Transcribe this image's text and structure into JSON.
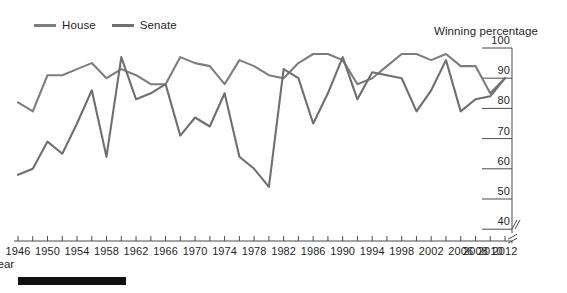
{
  "legend": {
    "items": [
      {
        "label": "House",
        "color": "#7d7d7d"
      },
      {
        "label": "Senate",
        "color": "#6f6f6f"
      }
    ]
  },
  "axes": {
    "y_caption": "Winning percentage",
    "x_caption": "Year",
    "y_ticks": [
      "100",
      "90",
      "80",
      "70",
      "60",
      "50",
      "40"
    ],
    "x_ticks": [
      "1946",
      "1950",
      "1954",
      "1958",
      "1962",
      "1966",
      "1970",
      "1974",
      "1978",
      "1982",
      "1986",
      "1990",
      "1994",
      "1998",
      "2002",
      "2006",
      "2008",
      "2010",
      "2012"
    ],
    "y_axis_break": true,
    "x_axis_break": true
  },
  "chart_data": {
    "type": "line",
    "title": "",
    "subtitle": "",
    "xlabel": "Year",
    "ylabel": "Winning percentage",
    "ylim": [
      35,
      100
    ],
    "xlim": [
      1946,
      2012
    ],
    "grid": false,
    "legend_position": "top-left",
    "y_tick_values": [
      40,
      50,
      60,
      70,
      80,
      90,
      100
    ],
    "x_tick_values": [
      1946,
      1948,
      1950,
      1952,
      1954,
      1956,
      1958,
      1960,
      1962,
      1964,
      1966,
      1968,
      1970,
      1972,
      1974,
      1976,
      1978,
      1980,
      1982,
      1984,
      1986,
      1988,
      1990,
      1992,
      1994,
      1996,
      1998,
      2000,
      2002,
      2004,
      2006,
      2008,
      2010,
      2012
    ],
    "x_labeled_values": [
      1946,
      1950,
      1954,
      1958,
      1962,
      1966,
      1970,
      1974,
      1978,
      1982,
      1986,
      1990,
      1994,
      1998,
      2002,
      2006,
      2008,
      2010,
      2012
    ],
    "x": [
      1946,
      1948,
      1950,
      1952,
      1954,
      1956,
      1958,
      1960,
      1962,
      1964,
      1966,
      1968,
      1970,
      1972,
      1974,
      1976,
      1978,
      1980,
      1982,
      1984,
      1986,
      1988,
      1990,
      1992,
      1994,
      1996,
      1998,
      2000,
      2002,
      2004,
      2006,
      2008,
      2010,
      2012
    ],
    "series": [
      {
        "name": "House",
        "color": "#7d7d7d",
        "values": [
          82,
          79,
          91,
          91,
          93,
          95,
          90,
          93,
          91,
          88,
          88,
          97,
          95,
          94,
          88,
          96,
          94,
          91,
          90,
          95,
          98,
          98,
          96,
          88,
          90,
          94,
          98,
          98,
          96,
          98,
          94,
          94,
          85,
          90
        ]
      },
      {
        "name": "Senate",
        "color": "#6f6f6f",
        "values": [
          58,
          60,
          69,
          65,
          75,
          86,
          64,
          97,
          83,
          85,
          88,
          71,
          77,
          74,
          85,
          64,
          60,
          54,
          93,
          90,
          75,
          85,
          97,
          83,
          92,
          91,
          90,
          79,
          86,
          96,
          79,
          83,
          84,
          90
        ]
      }
    ]
  }
}
